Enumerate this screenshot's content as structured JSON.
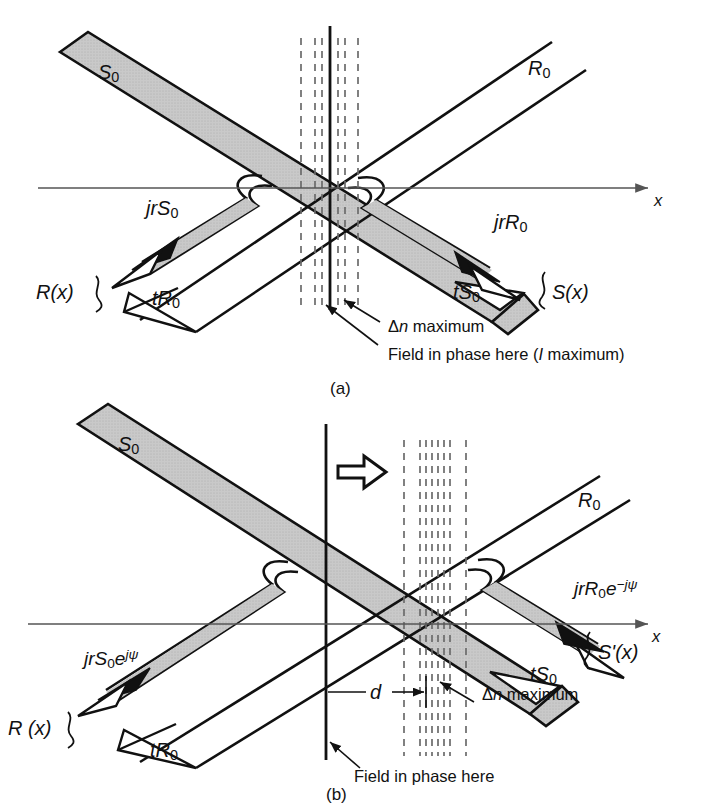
{
  "figure": {
    "colors": {
      "beam_fill": "#c6c6c6",
      "outline": "#111111",
      "axis": "#555555",
      "dashed": "#6b6b6b",
      "background": "#ffffff"
    }
  },
  "panels": [
    {
      "id": "a",
      "caption": "(a)",
      "axis_label": "x",
      "labels": {
        "incident_s": "S",
        "incident_s_sub": "0",
        "incident_r": "R",
        "incident_r_sub": "0",
        "refl_s": "jrS",
        "refl_s_sub": "0",
        "refl_r": "jrR",
        "refl_r_sub": "0",
        "trans_r": "tR",
        "trans_r_sub": "0",
        "trans_s": "tS",
        "trans_s_sub": "0",
        "brace_left": "R(x)",
        "brace_right": "S(x)"
      },
      "annotations": [
        {
          "name": "dn-maximum",
          "text_prefix": "Δ",
          "text_italic": "n",
          "text_suffix": " maximum"
        },
        {
          "name": "field-in-phase",
          "text_prefix": "Field in phase here (",
          "text_italic": "I",
          "text_suffix": " maximum)"
        }
      ],
      "grating_lines": 7
    },
    {
      "id": "b",
      "caption": "(b)",
      "axis_label": "x",
      "labels": {
        "incident_s": "S",
        "incident_s_sub": "0",
        "incident_r": "R",
        "incident_r_sub": "0",
        "refl_s": "jrS",
        "refl_s_sub": "0",
        "refl_s_exp": "e",
        "refl_s_exp_sup": "jψ",
        "refl_r": "jrR",
        "refl_r_sub": "0",
        "refl_r_exp": "e",
        "refl_r_exp_sup": "−jψ",
        "trans_r": "tR",
        "trans_r_sub": "0",
        "trans_s": "tS",
        "trans_s_sub": "0",
        "brace_left": "R (x)",
        "brace_right": "S'(x)",
        "shift_dimension": "d"
      },
      "annotations": [
        {
          "name": "dn-maximum",
          "text_prefix": "Δ",
          "text_italic": "n",
          "text_suffix": " maximum"
        },
        {
          "name": "field-in-phase",
          "text_prefix": "Field in phase here",
          "text_italic": "",
          "text_suffix": ""
        }
      ],
      "shift_arrow": "shift-right-arrow",
      "grating_lines": 9
    }
  ]
}
